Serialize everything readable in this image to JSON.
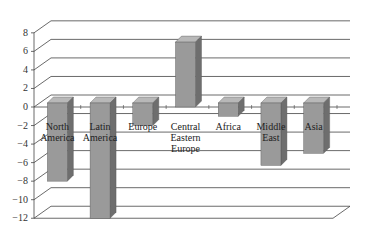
{
  "chart_data": {
    "type": "bar",
    "style": "3d-column",
    "title": "",
    "xlabel": "",
    "ylabel": "",
    "categories": [
      "North America",
      "Latin America",
      "Europe",
      "Central Eastern Europe",
      "Africa",
      "Middle East",
      "Asia"
    ],
    "category_lines": [
      [
        "North",
        "America"
      ],
      [
        "Latin",
        "America"
      ],
      [
        "Europe"
      ],
      [
        "Central",
        "Eastern",
        "Europe"
      ],
      [
        "Africa"
      ],
      [
        "Middle",
        "East"
      ],
      [
        "Asia"
      ]
    ],
    "values": [
      -8,
      -12,
      -2,
      7,
      -1,
      -6.3,
      -5
    ],
    "ylim": [
      -12,
      8
    ],
    "yticks": [
      8,
      6,
      4,
      2,
      0,
      -2,
      -4,
      -6,
      -8,
      -10,
      -12
    ],
    "ytick_labels": [
      "8",
      "6",
      "4",
      "2",
      "0",
      "−2",
      "−4",
      "−6",
      "−8",
      "−10",
      "−12"
    ],
    "grid": true,
    "legend": null
  },
  "colors": {
    "bar_front": "#9a9a9a",
    "bar_side": "#6e6e6e",
    "bar_top": "#b8b8b8",
    "grid": "#444444"
  }
}
